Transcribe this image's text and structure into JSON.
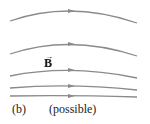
{
  "diagram": {
    "panel_label": "(b)",
    "caption": "(possible)",
    "field_symbol": "B",
    "vector_arrow": "→",
    "line_color": "#8a8a8a",
    "field_lines": [
      {
        "start": [
          10,
          21
        ],
        "control": [
          70,
          0
        ],
        "end": [
          137,
          23
        ]
      },
      {
        "start": [
          10,
          54
        ],
        "control": [
          70,
          34
        ],
        "end": [
          137,
          56
        ]
      },
      {
        "start": [
          10,
          76
        ],
        "control": [
          70,
          64
        ],
        "end": [
          137,
          78
        ]
      },
      {
        "start": [
          10,
          88
        ],
        "control": [
          70,
          83
        ],
        "end": [
          137,
          90
        ]
      },
      {
        "start": [
          10,
          96
        ],
        "control": [
          70,
          95
        ],
        "end": [
          137,
          97
        ]
      }
    ],
    "arrow_x": 70,
    "arrow_direction": "right"
  }
}
